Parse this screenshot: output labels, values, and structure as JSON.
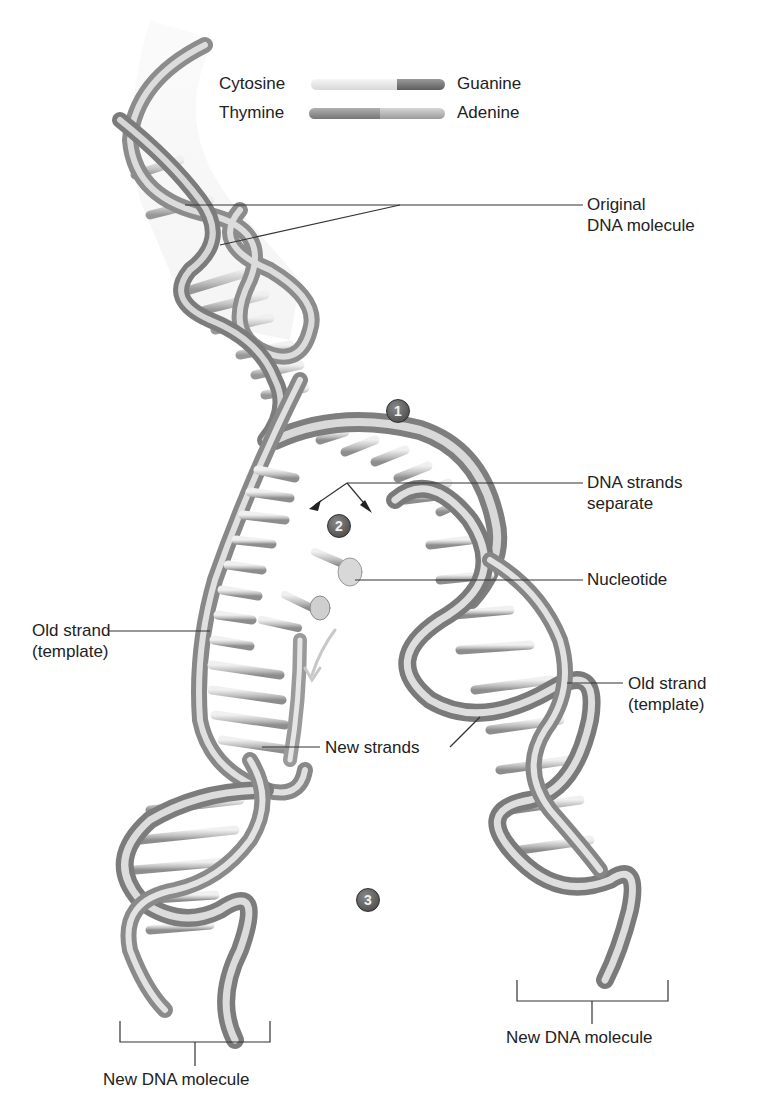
{
  "legend": {
    "pairs": [
      {
        "left": "Cytosine",
        "right": "Guanine",
        "left_color": "#e6e6e6",
        "right_color": "#7a7a7a"
      },
      {
        "left": "Thymine",
        "right": "Adenine",
        "left_color": "#8c8c8c",
        "right_color": "#b8b8b8"
      }
    ]
  },
  "labels": {
    "original_dna": [
      "Original",
      "DNA molecule"
    ],
    "strands_separate": [
      "DNA strands",
      "separate"
    ],
    "nucleotide": "Nucleotide",
    "old_strand_left": [
      "Old strand",
      "(template)"
    ],
    "old_strand_right": [
      "Old strand",
      "(template)"
    ],
    "new_strands": "New strands",
    "new_dna_left": "New DNA molecule",
    "new_dna_right": "New DNA molecule"
  },
  "steps": [
    "1",
    "2",
    "3"
  ],
  "colors": {
    "strand_light": "#e2e2e2",
    "strand_mid": "#a8a8a8",
    "strand_dark": "#6e6e6e",
    "leader_line": "#333333",
    "step_badge": "#555555"
  }
}
